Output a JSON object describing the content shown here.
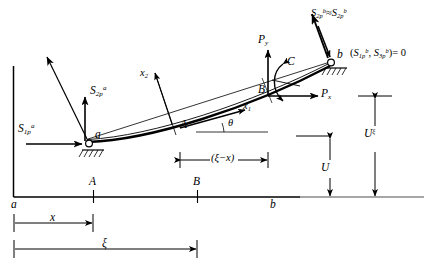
{
  "figure": {
    "type": "engineering-diagram",
    "background_color": "#ffffff",
    "line_color": "#000000"
  },
  "forces": {
    "left_horizontal": {
      "base": "S",
      "sub": "1p",
      "sup": "a",
      "text": "S"
    },
    "left_vertical": {
      "base": "S",
      "sub": "2p",
      "sup": "a",
      "text": "S"
    },
    "right_diagonal": {
      "text": "S",
      "sub1": "2p",
      "sup1": "b",
      "relation": "≈",
      "sub2": "2p",
      "sup2": "b"
    },
    "right_zero_condition": {
      "open": "(",
      "first_sub": "1p",
      "first_sup": "b",
      "separator": ", ",
      "second_sub": "3p",
      "second_sup": "b",
      "close": ")",
      "equals": "= 0",
      "base": "S"
    },
    "applied_px": {
      "text": "P",
      "sub": "x"
    },
    "applied_py": {
      "text": "P",
      "sub": "y"
    },
    "applied_couple": {
      "text": "C"
    }
  },
  "axes": {
    "x1": {
      "text": "x",
      "sub": "1"
    },
    "x2": {
      "text": "x",
      "sub": "2"
    },
    "angle": {
      "text": "θ"
    }
  },
  "points": {
    "node_a_upper": "a",
    "node_b_upper": "b",
    "section_A_upper": "A",
    "section_B_upper": "B",
    "baseline_a": "a",
    "baseline_b": "b",
    "baseline_A": "A",
    "baseline_B": "B"
  },
  "dimensions": {
    "x_distance": {
      "text": "x"
    },
    "xi_distance": {
      "text": "ξ"
    },
    "xi_minus_x": {
      "text": "(ξ−x)"
    },
    "U": {
      "text": "U"
    },
    "U_xi": {
      "base": "U",
      "sup": "ξ"
    }
  }
}
